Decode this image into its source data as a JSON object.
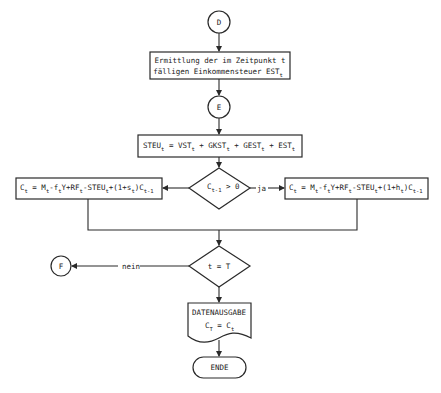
{
  "diagram": {
    "type": "flowchart",
    "language": "de",
    "connectors": {
      "start": "D",
      "mid": "E",
      "exit": "F"
    },
    "process_est": {
      "line1": "Ermittlung der im Zeitpunkt t",
      "line2_main": "fälligen Einkommensteuer EST",
      "line2_sub": "t"
    },
    "process_steu": {
      "parts": [
        {
          "main": "STEU",
          "sub": "t"
        },
        {
          "main": " = VST",
          "sub": "t"
        },
        {
          "main": " + GKST",
          "sub": "t"
        },
        {
          "main": " + GEST",
          "sub": "t"
        },
        {
          "main": " + EST",
          "sub": "t"
        }
      ]
    },
    "decision_capital": {
      "main": "C",
      "sub": "t-1",
      "rest": " > 0",
      "yes_label": "ja"
    },
    "process_left": {
      "parts": [
        {
          "main": "C",
          "sub": "t"
        },
        {
          "main": " = M",
          "sub": "t"
        },
        {
          "main": "-f",
          "sub": "t"
        },
        {
          "main": "Y+RF",
          "sub": "t"
        },
        {
          "main": "-STEU",
          "sub": "t"
        },
        {
          "main": "+(1+s",
          "sub": "t"
        },
        {
          "main": ")C",
          "sub": "t-1"
        }
      ]
    },
    "process_right": {
      "parts": [
        {
          "main": "C",
          "sub": "t"
        },
        {
          "main": " = M",
          "sub": "t"
        },
        {
          "main": "-f",
          "sub": "t"
        },
        {
          "main": "Y+RF",
          "sub": "t"
        },
        {
          "main": "-STEU",
          "sub": "t"
        },
        {
          "main": "+(1+h",
          "sub": "t"
        },
        {
          "main": ")C",
          "sub": "t-1"
        }
      ]
    },
    "decision_end": {
      "text": "t = T",
      "no_label": "nein"
    },
    "output_doc": {
      "title": "DATENAUSGABE",
      "formula_main1": "C",
      "formula_sub1": "T",
      "formula_eq": " = C",
      "formula_sub2": "t"
    },
    "terminator": {
      "label": "ENDE"
    }
  }
}
